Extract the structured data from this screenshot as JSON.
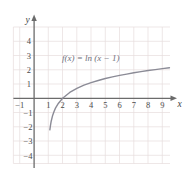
{
  "chart_data": {
    "type": "line",
    "title": "",
    "annotations": [
      {
        "name": "function-equation",
        "text": "f(x) = ln (x − 1)",
        "x": 4.0,
        "y": 2.75
      }
    ],
    "xlabel": "x",
    "ylabel": "y",
    "xlim": [
      -1.6,
      10.2
    ],
    "ylim": [
      -4.8,
      4.8
    ],
    "grid": true,
    "legend": "none",
    "xticks": [
      -1,
      1,
      2,
      3,
      4,
      5,
      6,
      7,
      8,
      9
    ],
    "xtick_labels": [
      "−1",
      "1",
      "2",
      "3",
      "4",
      "5",
      "6",
      "7",
      "8",
      "9"
    ],
    "yticks": [
      4,
      3,
      2,
      1,
      -1,
      -2,
      -3,
      -4
    ],
    "ytick_labels": [
      "4",
      "3",
      "2",
      "1",
      "−1",
      "−2",
      "−3",
      "−4"
    ],
    "series": [
      {
        "name": "f(x) = ln (x − 1)",
        "expression": "ln(x - 1)",
        "asymptote_x": 1,
        "x_intercept": 2,
        "color": "#8b8b96",
        "x": [
          1.105,
          1.15,
          1.2,
          1.3,
          1.4,
          1.5,
          1.7,
          2.0,
          2.5,
          3.0,
          3.5,
          4.0,
          4.5,
          5.0,
          5.5,
          6.0,
          6.5,
          7.0,
          7.5,
          8.0,
          8.5,
          9.0,
          9.5
        ],
        "y": [
          -2.21,
          -1.9,
          -1.61,
          -1.2,
          -0.92,
          -0.69,
          -0.36,
          0.0,
          0.41,
          0.69,
          0.92,
          1.1,
          1.25,
          1.39,
          1.5,
          1.61,
          1.7,
          1.79,
          1.87,
          1.95,
          2.01,
          2.08,
          2.14
        ]
      }
    ]
  },
  "figure": {
    "axis_color": "#6b6b6b",
    "grid_color": "#e6dcdc",
    "curve_color": "#8b8b96",
    "background": "#ffffff"
  }
}
